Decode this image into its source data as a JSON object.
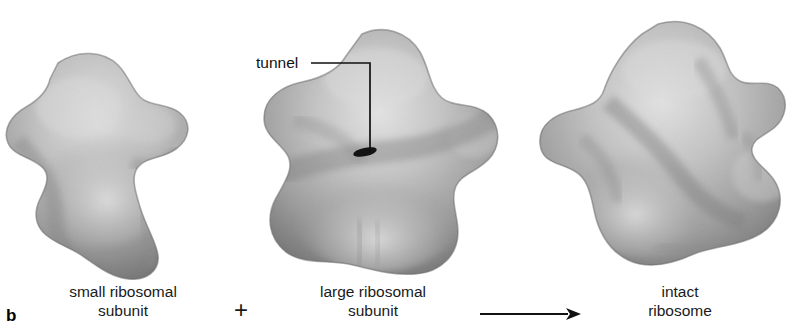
{
  "figure": {
    "panel_letter": "b",
    "background_color": "#ffffff",
    "ink_color": "#1a1a1a"
  },
  "annotations": {
    "tunnel_label": "tunnel",
    "plus_symbol": "+",
    "arrow_symbol": "arrow-right"
  },
  "items": [
    {
      "id": "small-subunit",
      "caption_line1": "small ribosomal",
      "caption_line2": "subunit",
      "shape_name": "small-ribosomal-subunit-blob",
      "fill_light": "#d8d8d8",
      "fill_mid": "#ababab",
      "fill_dark": "#6d6d6d"
    },
    {
      "id": "large-subunit",
      "caption_line1": "large ribosomal",
      "caption_line2": "subunit",
      "shape_name": "large-ribosomal-subunit-blob",
      "fill_light": "#dcdcdc",
      "fill_mid": "#a8a8a8",
      "fill_dark": "#6a6a6a"
    },
    {
      "id": "intact-ribosome",
      "caption_line1": "intact",
      "caption_line2": "ribosome",
      "shape_name": "intact-ribosome-blob",
      "fill_light": "#dadada",
      "fill_mid": "#a9a9a9",
      "fill_dark": "#6c6c6c"
    }
  ]
}
